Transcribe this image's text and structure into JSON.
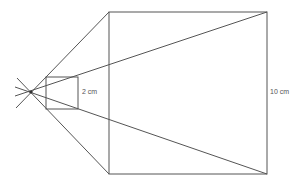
{
  "diagram": {
    "colors": {
      "line": "#555555",
      "background": "#ffffff"
    },
    "center_point": {
      "x": 31,
      "y": 92
    },
    "small_square": {
      "x": 46,
      "y": 77,
      "size": 32,
      "label": "2 cm"
    },
    "large_square": {
      "x": 109,
      "y": 12,
      "size": 158,
      "label": "10 cm"
    }
  }
}
